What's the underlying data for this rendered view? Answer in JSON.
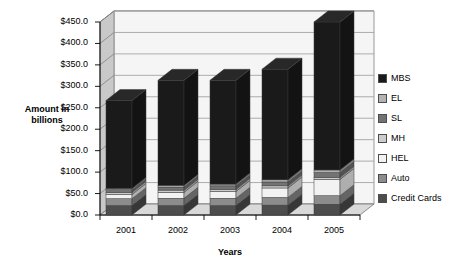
{
  "chart_data": {
    "type": "bar",
    "subtype": "stacked-column-3d",
    "title": "",
    "xlabel": "Years",
    "ylabel": "Amount in billions",
    "categories": [
      "2001",
      "2002",
      "2003",
      "2004",
      "2005"
    ],
    "ylim": [
      0,
      450
    ],
    "ytick_step": 50,
    "ytick_labels": [
      "$0.0",
      "$50.0",
      "$100.0",
      "$150.0",
      "$200.0",
      "$250.0",
      "$300.0",
      "$350.0",
      "$400.0",
      "$450.0"
    ],
    "ytick_values": [
      0,
      50,
      100,
      150,
      200,
      250,
      300,
      350,
      400,
      450
    ],
    "grid": true,
    "grid_axis": "y",
    "legend_position": "right",
    "stack_order_bottom_to_top": [
      "Credit Cards",
      "Auto",
      "HEL",
      "MH",
      "SL",
      "EL",
      "MBS"
    ],
    "series": [
      {
        "name": "MBS",
        "color": "#1a1a1a",
        "values": [
          205.0,
          245.0,
          242.0,
          258.0,
          345.0
        ]
      },
      {
        "name": "EL",
        "color": "#b3b3b3",
        "values": [
          3.0,
          4.0,
          4.0,
          5.0,
          6.0
        ]
      },
      {
        "name": "SL",
        "color": "#737373",
        "values": [
          6.0,
          7.0,
          8.0,
          9.0,
          11.0
        ]
      },
      {
        "name": "MH",
        "color": "#cccccc",
        "values": [
          5.0,
          5.0,
          5.0,
          5.0,
          5.0
        ]
      },
      {
        "name": "HEL",
        "color": "#f2f2f2",
        "values": [
          10.0,
          14.0,
          16.0,
          22.0,
          38.0
        ]
      },
      {
        "name": "Auto",
        "color": "#8c8c8c",
        "values": [
          16.0,
          17.0,
          17.0,
          18.0,
          20.0
        ]
      },
      {
        "name": "Credit Cards",
        "color": "#4d4d4d",
        "values": [
          22.0,
          22.0,
          22.0,
          23.0,
          25.0
        ]
      }
    ],
    "totals": [
      267.0,
      314.0,
      314.0,
      340.0,
      450.0
    ]
  },
  "legend": {
    "items": [
      {
        "label": "MBS"
      },
      {
        "label": "EL"
      },
      {
        "label": "SL"
      },
      {
        "label": "MH"
      },
      {
        "label": "HEL"
      },
      {
        "label": "Auto"
      },
      {
        "label": "Credit Cards"
      }
    ]
  },
  "axis": {
    "y_title_line1": "Amount in",
    "y_title_line2": "billions",
    "x_title": "Years"
  }
}
